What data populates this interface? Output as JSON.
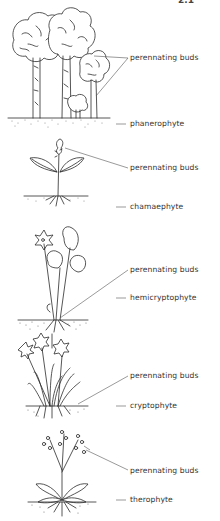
{
  "figure": {
    "number_partial": "2.1"
  },
  "diagram": {
    "life_forms": [
      {
        "name": "phanerophyte",
        "buds_label": "perennating buds",
        "buds_y": 58,
        "name_y": 124
      },
      {
        "name": "chamaephyte",
        "buds_label": "perennating buds",
        "buds_y": 168,
        "name_y": 207
      },
      {
        "name": "hemicryptophyte",
        "buds_label": "perennating buds",
        "buds_y": 268,
        "name_y": 298
      },
      {
        "name": "cryptophyte",
        "buds_label": "perennating buds",
        "buds_y": 373,
        "name_y": 406
      },
      {
        "name": "therophyte",
        "buds_label": "perennating buds",
        "buds_y": 470,
        "name_y": 500
      }
    ]
  }
}
